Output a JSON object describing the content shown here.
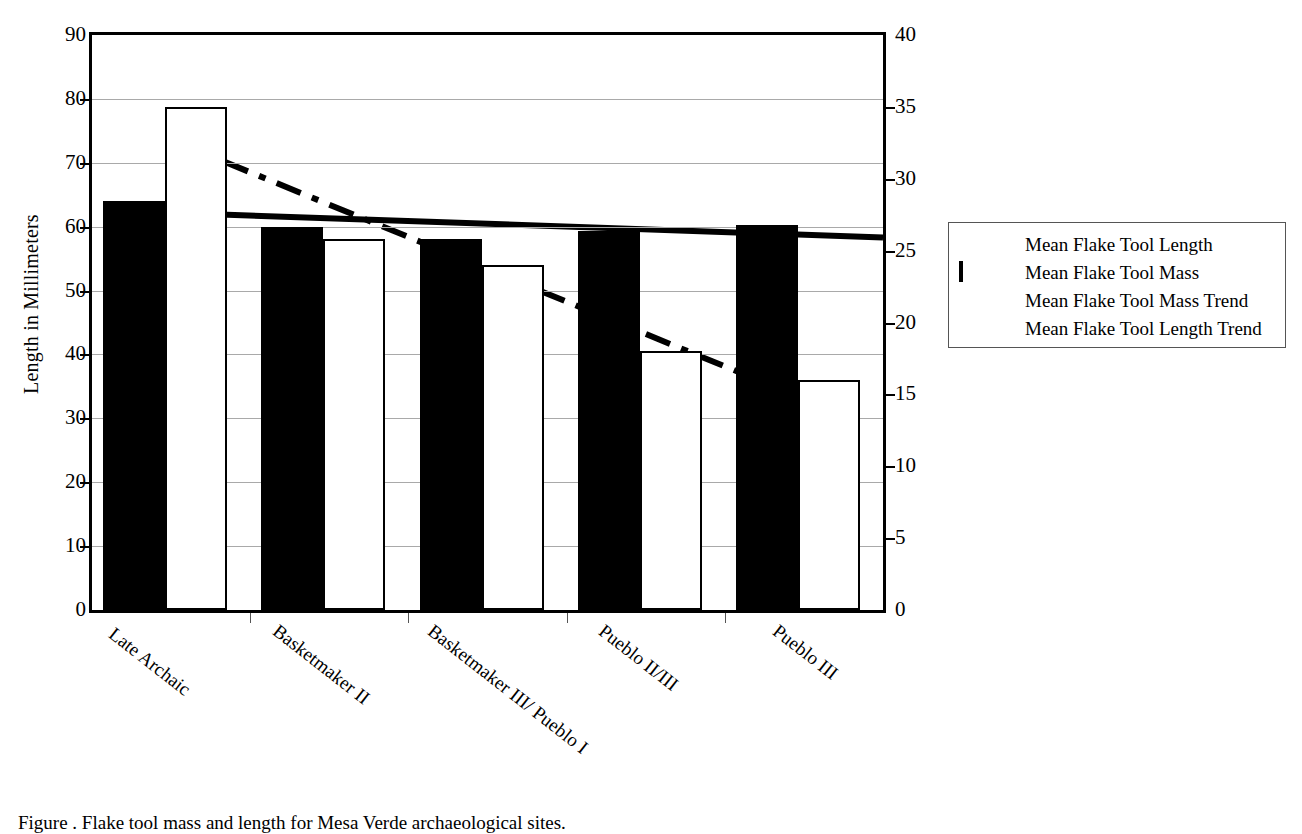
{
  "chart_data": {
    "type": "bar",
    "title": "",
    "xlabel": "",
    "ylabel": "Length in Millimeters",
    "y2label": "",
    "categories": [
      "Late Archaic",
      "Basketmaker II",
      "Basketmaker III/ Pueblo I",
      "Pueblo II/III",
      "Pueblo III"
    ],
    "ylim": [
      0,
      90
    ],
    "yticks": [
      0,
      10,
      20,
      30,
      40,
      50,
      60,
      70,
      80,
      90
    ],
    "y2lim": [
      0,
      40
    ],
    "y2ticks": [
      0,
      5,
      10,
      15,
      20,
      25,
      30,
      35,
      40
    ],
    "grid": true,
    "legend_position": "right",
    "series": [
      {
        "name": "Mean Flake Tool Length",
        "style": "bar-filled",
        "axis": "left",
        "unit": "mm",
        "values": [
          64.0,
          60.0,
          58.0,
          59.3,
          60.2
        ]
      },
      {
        "name": "Mean Flake Tool Mass",
        "style": "bar-open",
        "axis": "right",
        "unit": "g",
        "values": [
          35.0,
          25.8,
          24.0,
          18.0,
          16.0
        ]
      },
      {
        "name": "Mean Flake Tool Mass Trend",
        "style": "line-dashed",
        "axis": "right",
        "endpoints": [
          {
            "x": 0.5,
            "y": 32.7
          },
          {
            "x": 4.5,
            "y": 14.7
          }
        ]
      },
      {
        "name": "Mean Flake Tool Length Trend",
        "style": "line-solid",
        "axis": "left",
        "endpoints": [
          {
            "x": 0.45,
            "y": 62.2
          },
          {
            "x": 5.0,
            "y": 58.3
          }
        ]
      }
    ]
  },
  "legend": {
    "items": [
      {
        "label": "Mean Flake Tool Length",
        "key": "solid-bar-key"
      },
      {
        "label": "Mean Flake Tool Mass",
        "key": "open-bar-key"
      },
      {
        "label": "Mean Flake Tool Mass Trend",
        "key": "dashed-line-key"
      },
      {
        "label": "Mean Flake Tool Length Trend",
        "key": "solid-line-key"
      }
    ]
  },
  "caption": "Figure      .  Flake tool mass and length for Mesa Verde archaeological sites."
}
